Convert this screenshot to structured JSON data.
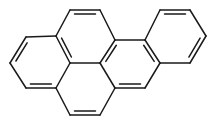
{
  "diagram": {
    "type": "chemical-structure",
    "stroke_color": "#1a1a1a",
    "background": "#ffffff",
    "caption_cut_off": true,
    "atoms": [
      [
        70,
        10
      ],
      [
        100,
        10
      ],
      [
        115,
        40
      ],
      [
        100,
        63
      ],
      [
        70,
        63
      ],
      [
        56,
        36
      ],
      [
        26,
        37
      ],
      [
        10,
        63
      ],
      [
        26,
        88
      ],
      [
        56,
        88
      ],
      [
        70,
        115
      ],
      [
        100,
        115
      ],
      [
        115,
        88
      ],
      [
        145,
        40
      ],
      [
        160,
        63
      ],
      [
        145,
        88
      ],
      [
        160,
        10
      ],
      [
        190,
        10
      ],
      [
        206,
        36
      ],
      [
        190,
        63
      ]
    ],
    "single_bonds": [
      [
        1,
        2
      ],
      [
        3,
        4
      ],
      [
        5,
        0
      ],
      [
        5,
        6
      ],
      [
        7,
        8
      ],
      [
        9,
        4
      ],
      [
        9,
        10
      ],
      [
        11,
        12
      ],
      [
        2,
        13
      ],
      [
        14,
        15
      ],
      [
        12,
        3
      ],
      [
        13,
        16
      ],
      [
        17,
        18
      ],
      [
        19,
        14
      ]
    ],
    "double_bonds": [
      [
        0,
        1,
        "in"
      ],
      [
        2,
        3,
        "in"
      ],
      [
        4,
        5,
        "in"
      ],
      [
        6,
        7,
        "in"
      ],
      [
        8,
        9,
        "in"
      ],
      [
        10,
        11,
        "in"
      ],
      [
        12,
        15,
        "in"
      ],
      [
        13,
        14,
        "in"
      ],
      [
        16,
        17,
        "in"
      ],
      [
        18,
        19,
        "in"
      ]
    ]
  }
}
